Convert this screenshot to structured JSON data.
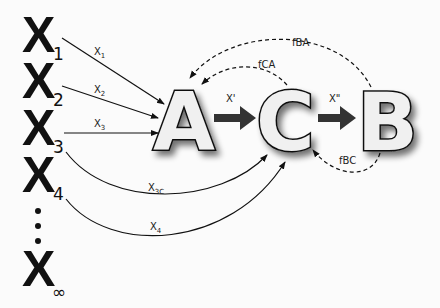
{
  "inputs": [
    {
      "symbol": "X",
      "sub": "1",
      "flux_label": "X",
      "flux_sub": "1",
      "target": "A"
    },
    {
      "symbol": "X",
      "sub": "2",
      "flux_label": "X",
      "flux_sub": "2",
      "target": "A"
    },
    {
      "symbol": "X",
      "sub": "3",
      "flux_label": "X",
      "flux_sub": "3",
      "target": "A"
    },
    {
      "symbol": "X",
      "sub": "3",
      "flux_label": "X",
      "flux_sub": "3C",
      "target": "C"
    },
    {
      "symbol": "X",
      "sub": "4",
      "flux_label": "X",
      "flux_sub": "4",
      "target": "C"
    },
    {
      "symbol": "X",
      "sub": "∞"
    }
  ],
  "ellipsis": "⋮",
  "nodes": [
    {
      "id": "A",
      "label": "A"
    },
    {
      "id": "C",
      "label": "C"
    },
    {
      "id": "B",
      "label": "B"
    }
  ],
  "forward_edges": [
    {
      "from": "A",
      "to": "C",
      "label": "X'"
    },
    {
      "from": "C",
      "to": "B",
      "label": "X\""
    }
  ],
  "feedback_edges": [
    {
      "from": "B",
      "to": "A",
      "label": "fBA"
    },
    {
      "from": "C",
      "to": "A",
      "label": "fCA"
    },
    {
      "from": "B",
      "to": "C",
      "label": "fBC"
    }
  ]
}
